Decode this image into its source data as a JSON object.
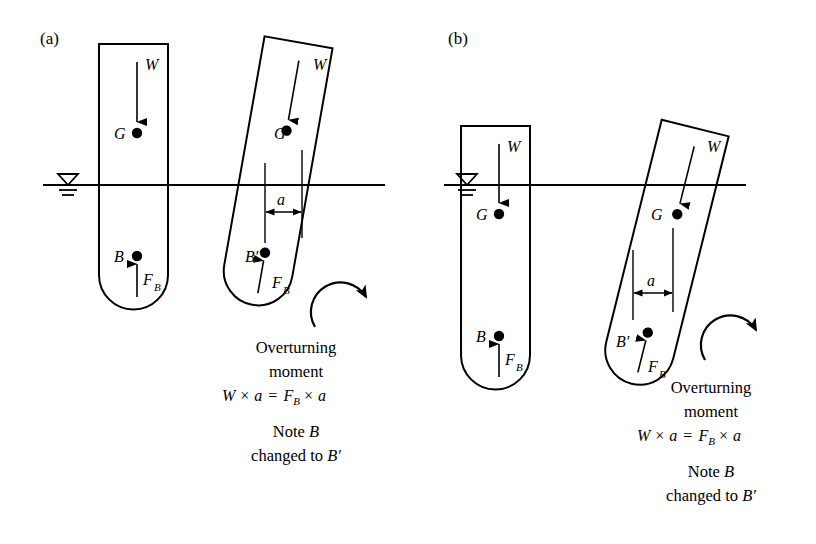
{
  "figure": {
    "background_color": "#ffffff",
    "line_color": "#000000",
    "width": 816,
    "height": 544
  },
  "panels": [
    {
      "id": "a",
      "label": "(a)",
      "description": "Floating body with centre of gravity G above the waterline",
      "waterline_y": 185,
      "upright_body": {
        "name": "upright-floating-body",
        "labels": {
          "weight": "W",
          "gravity_center": "G",
          "buoyancy_center": "B",
          "buoyant_force": "F",
          "buoyant_force_sub": "B"
        }
      },
      "tilted_body": {
        "name": "tilted-floating-body",
        "tilt_degrees": 10,
        "labels": {
          "weight": "W",
          "gravity_center": "G",
          "buoyancy_center": "B′",
          "buoyant_force": "F",
          "buoyant_force_sub": "B",
          "lever_arm": "a"
        }
      },
      "annotation": {
        "line1": "Overturning",
        "line2": "moment",
        "equation": {
          "w": "W",
          "times1": "×",
          "a1": "a",
          "equals": "=",
          "f": "F",
          "f_sub": "B",
          "times2": "×",
          "a2": "a"
        },
        "note_line1_prefix": "Note ",
        "note_line1_symbol": "B",
        "note_line2_prefix": "changed to ",
        "note_line2_symbol": "B′"
      },
      "rotation_arrow": {
        "name": "clockwise-rotation-arrow",
        "direction": "clockwise"
      }
    },
    {
      "id": "b",
      "label": "(b)",
      "description": "Floating body with centre of gravity G below the waterline, deeper draft",
      "waterline_y": 185,
      "upright_body": {
        "name": "upright-floating-body",
        "labels": {
          "weight": "W",
          "gravity_center": "G",
          "buoyancy_center": "B",
          "buoyant_force": "F",
          "buoyant_force_sub": "B"
        }
      },
      "tilted_body": {
        "name": "tilted-floating-body",
        "tilt_degrees": 14,
        "labels": {
          "weight": "W",
          "gravity_center": "G",
          "buoyancy_center": "B′",
          "buoyant_force": "F",
          "buoyant_force_sub": "B",
          "lever_arm": "a"
        }
      },
      "annotation": {
        "line1": "Overturning",
        "line2": "moment",
        "equation": {
          "w": "W",
          "times1": "×",
          "a1": "a",
          "equals": "=",
          "f": "F",
          "f_sub": "B",
          "times2": "×",
          "a2": "a"
        },
        "note_line1_prefix": "Note ",
        "note_line1_symbol": "B",
        "note_line2_prefix": "changed to ",
        "note_line2_symbol": "B′"
      },
      "rotation_arrow": {
        "name": "clockwise-rotation-arrow",
        "direction": "clockwise"
      }
    }
  ],
  "water_surface_symbol": {
    "name": "water-surface-level-symbol",
    "shape": "down-triangle-with-two-lines"
  }
}
